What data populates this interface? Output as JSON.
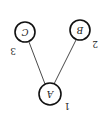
{
  "diagram": {
    "type": "tree",
    "orientation": "rotated-180",
    "nodes": [
      {
        "id": "A",
        "label": "A",
        "number": "1"
      },
      {
        "id": "B",
        "label": "B",
        "number": "2"
      },
      {
        "id": "C",
        "label": "C",
        "number": "3"
      }
    ],
    "edges": [
      {
        "from": "A",
        "to": "B"
      },
      {
        "from": "A",
        "to": "C"
      }
    ]
  }
}
